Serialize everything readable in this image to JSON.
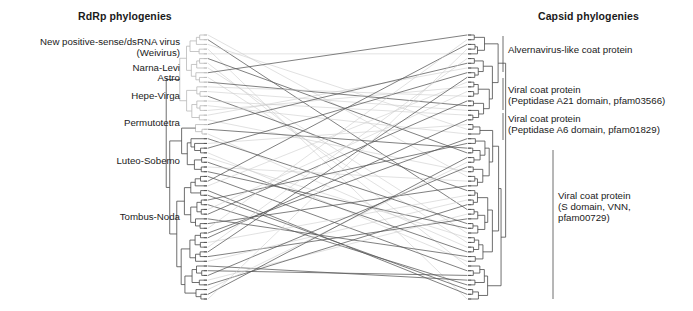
{
  "figure": {
    "type": "tanglegram",
    "headers": {
      "left": "RdRp phylogenies",
      "right": "Capsid phylogenies"
    },
    "left_labels": [
      {
        "text": "New positive-sense/dsRNA virus\n(Weivirus)",
        "x": 180,
        "y": 36,
        "align": "right"
      },
      {
        "text": "Narna-Levi",
        "x": 180,
        "y": 62,
        "align": "right"
      },
      {
        "text": "Astro",
        "x": 180,
        "y": 72,
        "align": "right"
      },
      {
        "text": "Hepe-Virga",
        "x": 180,
        "y": 90,
        "align": "right"
      },
      {
        "text": "Permutotetra",
        "x": 180,
        "y": 117,
        "align": "right"
      },
      {
        "text": "Luteo-Sobemo",
        "x": 180,
        "y": 155,
        "align": "right"
      },
      {
        "text": "Tombus-Noda",
        "x": 180,
        "y": 211,
        "align": "right"
      }
    ],
    "right_labels": [
      {
        "text": "Alvernavirus-like coat protein",
        "x": 508,
        "y": 44,
        "align": "left"
      },
      {
        "text": "Viral coat protein\n(Peptidase A21 domain, pfam03566)",
        "x": 508,
        "y": 84,
        "align": "left"
      },
      {
        "text": "Viral coat protein\n(Peptidase A6 domain, pfam01829)",
        "x": 508,
        "y": 113,
        "align": "left"
      },
      {
        "text": "Viral coat protein\n(S domain, VNN,\npfam00729)",
        "x": 558,
        "y": 190,
        "align": "left"
      }
    ],
    "colors": {
      "background": "#ffffff",
      "text": "#1a1a1a",
      "tree_dark": "#4a4a4a",
      "tree_light": "#b9b9b9",
      "link_dark": "#555555",
      "link_light": "#cccccc"
    },
    "geometry": {
      "left_tip_x": 207,
      "right_tip_x": 468,
      "tree_top_y": 35,
      "tree_bottom_y": 299,
      "n_left_tips": 57,
      "n_right_tips": 57
    }
  }
}
